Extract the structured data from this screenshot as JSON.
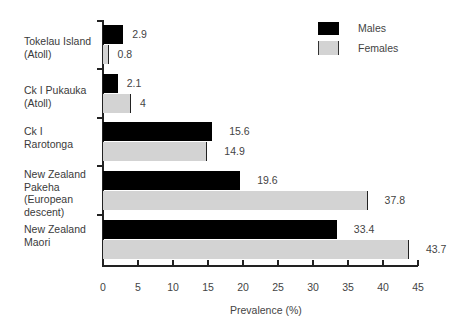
{
  "chart_data": {
    "type": "bar",
    "orientation": "horizontal",
    "title": "",
    "xlabel": "Prevalence (%)",
    "ylabel": "",
    "xlim": [
      0,
      45
    ],
    "xticks": [
      "0",
      "5",
      "10",
      "15",
      "20",
      "25",
      "30",
      "35",
      "40",
      "45"
    ],
    "grid": false,
    "legend_position": "top-right",
    "categories": [
      "Tokelau Island\n(Atoll)",
      "Ck I Pukauka\n(Atoll)",
      "Ck I\nRarotonga",
      "New Zealand\nPakeha\n(European\ndescent)",
      "New Zealand\nMaori"
    ],
    "series": [
      {
        "name": "Males",
        "color": "#000000",
        "values": [
          2.9,
          2.1,
          15.6,
          19.6,
          33.4
        ],
        "labels": [
          "2.9",
          "2.1",
          "15.6",
          "19.6",
          "33.4"
        ]
      },
      {
        "name": "Females",
        "color": "#d3d3d3",
        "values": [
          0.8,
          4,
          14.9,
          37.8,
          43.7
        ],
        "labels": [
          "0.8",
          "4",
          "14.9",
          "37.8",
          "43.7"
        ]
      }
    ]
  },
  "legend": {
    "males": "Males",
    "females": "Females"
  },
  "axis": {
    "xlabel": "Prevalence (%)"
  }
}
